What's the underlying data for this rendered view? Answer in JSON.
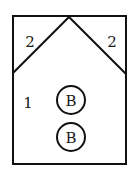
{
  "diagram": {
    "regions": [
      {
        "id": "left-corner",
        "label": "2"
      },
      {
        "id": "right-corner",
        "label": "2"
      },
      {
        "id": "main",
        "label": "1"
      }
    ],
    "markers": [
      {
        "label": "B"
      },
      {
        "label": "B"
      }
    ],
    "stroke_color": "#111111",
    "background_color": "#ffffff"
  }
}
